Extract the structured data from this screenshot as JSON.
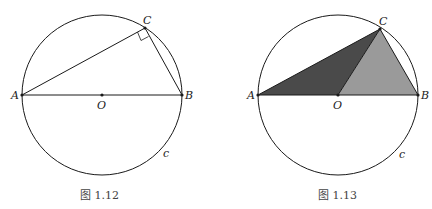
{
  "figures": [
    {
      "caption": "图 1.12",
      "labels": {
        "A": "A",
        "B": "B",
        "C": "C",
        "O": "O",
        "c": "c"
      },
      "description": "Circle c with diameter AB, center O, inscribed right triangle ABC with right angle at C"
    },
    {
      "caption": "图 1.13",
      "labels": {
        "A": "A",
        "B": "B",
        "C": "C",
        "O": "O",
        "c": "c"
      },
      "description": "Circle c with diameter AB, center O, triangle ABC split by OC into dark triangle AOC and light triangle OBC"
    }
  ],
  "colors": {
    "stroke": "#1a1a1a",
    "dark_fill": "#4a4a4a",
    "light_fill": "#9a9a9a"
  }
}
